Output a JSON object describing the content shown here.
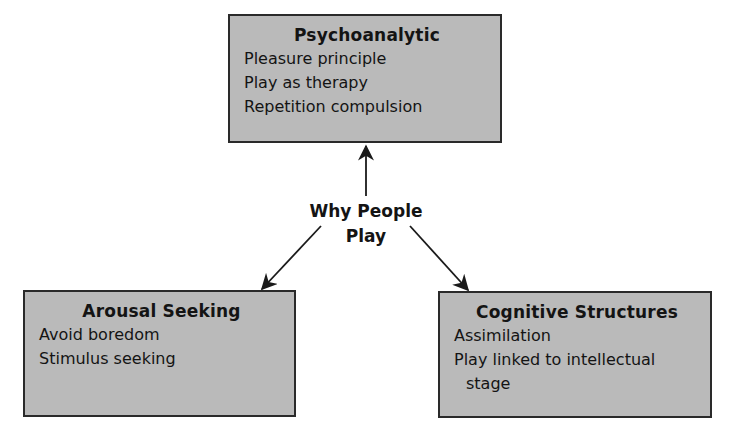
{
  "diagram": {
    "center": {
      "line1": "Why People",
      "line2": "Play"
    },
    "nodes": [
      {
        "id": "psychoanalytic",
        "title": "Psychoanalytic",
        "items": [
          "Pleasure principle",
          "Play as therapy",
          "Repetition compulsion"
        ]
      },
      {
        "id": "arousal-seeking",
        "title": "Arousal Seeking",
        "items": [
          "Avoid boredom",
          "Stimulus seeking"
        ]
      },
      {
        "id": "cognitive-structures",
        "title": "Cognitive Structures",
        "items": [
          "Assimilation",
          "Play linked to intellectual"
        ],
        "item_continuation": "stage"
      }
    ],
    "edges": [
      {
        "from": "center",
        "to": "psychoanalytic"
      },
      {
        "from": "center",
        "to": "arousal-seeking"
      },
      {
        "from": "center",
        "to": "cognitive-structures"
      }
    ],
    "colors": {
      "box_fill": "#bababa",
      "box_border": "#2a2a2a",
      "text": "#141414",
      "arrow": "#1a1a1a"
    }
  }
}
